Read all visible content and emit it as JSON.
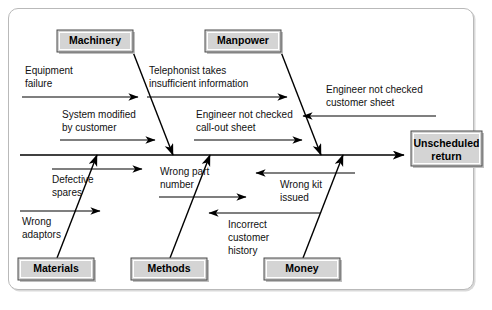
{
  "diagram": {
    "type": "fishbone-ishikawa",
    "title": "",
    "effect": {
      "label_line1": "Unscheduled",
      "label_line2": "return",
      "box_fill": "#d4d4d4",
      "box_stroke": "#4a4a4a"
    },
    "spine": {
      "x1": 20,
      "x2": 404,
      "y": 155,
      "arrow": "right"
    },
    "categories": [
      {
        "id": "machinery",
        "label": "Machinery",
        "position": "top",
        "box": {
          "x": 57,
          "y": 30,
          "w": 76,
          "h": 22
        },
        "rib": {
          "x1": 133,
          "y1": 52,
          "x2": 173,
          "y2": 155
        },
        "causes": [
          {
            "id": "equipment-failure",
            "line1": "Equipment",
            "line2": "failure",
            "text_x": 25,
            "text_y": 74,
            "arrow": {
              "x1": 22,
              "y1": 97,
              "x2": 138,
              "y2": 97,
              "dir": "right"
            }
          },
          {
            "id": "system-modified-by-customer",
            "line1": "System modified",
            "line2": "by customer",
            "text_x": 62,
            "text_y": 118,
            "arrow": {
              "x1": 60,
              "y1": 140,
              "x2": 155,
              "y2": 140,
              "dir": "right"
            }
          }
        ]
      },
      {
        "id": "manpower",
        "label": "Manpower",
        "position": "top",
        "box": {
          "x": 205,
          "y": 30,
          "w": 76,
          "h": 22
        },
        "rib": {
          "x1": 281,
          "y1": 52,
          "x2": 321,
          "y2": 155
        },
        "causes": [
          {
            "id": "telephonist-takes-insufficient-information",
            "line1": "Telephonist takes",
            "line2": "insufficient information",
            "text_x": 149,
            "text_y": 74,
            "arrow": {
              "x1": 147,
              "y1": 97,
              "x2": 287,
              "y2": 97,
              "dir": "right"
            }
          },
          {
            "id": "engineer-not-checked-call-out-sheet",
            "line1": "Engineer not checked",
            "line2": "call-out sheet",
            "text_x": 196,
            "text_y": 118,
            "arrow": {
              "x1": 194,
              "y1": 140,
              "x2": 302,
              "y2": 140,
              "dir": "right"
            }
          },
          {
            "id": "engineer-not-checked-customer-sheet",
            "line1": "Engineer not checked",
            "line2": "customer sheet",
            "text_x": 326,
            "text_y": 93,
            "arrow": {
              "x1": 436,
              "y1": 116,
              "x2": 302,
              "y2": 116,
              "dir": "left"
            }
          }
        ]
      },
      {
        "id": "materials",
        "label": "Materials",
        "position": "bottom",
        "box": {
          "x": 18,
          "y": 258,
          "w": 76,
          "h": 22
        },
        "rib": {
          "x1": 57,
          "y1": 258,
          "x2": 97,
          "y2": 155
        },
        "causes": [
          {
            "id": "defective-spares",
            "line1": "Defective",
            "line2": "spares",
            "text_x": 52,
            "text_y": 183,
            "arrow": {
              "x1": 52,
              "y1": 169,
              "x2": 142,
              "y2": 169,
              "dir": "right"
            }
          },
          {
            "id": "wrong-adaptors",
            "line1": "Wrong",
            "line2": "adaptors",
            "text_x": 22,
            "text_y": 225,
            "arrow": {
              "x1": 20,
              "y1": 211,
              "x2": 100,
              "y2": 211,
              "dir": "right"
            }
          }
        ]
      },
      {
        "id": "methods",
        "label": "Methods",
        "position": "bottom",
        "box": {
          "x": 131,
          "y": 258,
          "w": 76,
          "h": 22
        },
        "rib": {
          "x1": 170,
          "y1": 258,
          "x2": 210,
          "y2": 155
        },
        "causes": [
          {
            "id": "wrong-part-number",
            "line1": "Wrong part",
            "line2": "number",
            "text_x": 160,
            "text_y": 175,
            "arrow": {
              "x1": 159,
              "y1": 197,
              "x2": 246,
              "y2": 197,
              "dir": "right"
            }
          }
        ]
      },
      {
        "id": "money",
        "label": "Money",
        "position": "bottom",
        "box": {
          "x": 264,
          "y": 258,
          "w": 76,
          "h": 22
        },
        "rib": {
          "x1": 303,
          "y1": 258,
          "x2": 343,
          "y2": 155
        },
        "causes": [
          {
            "id": "wrong-kit-issued",
            "line1": "Wrong kit",
            "line2": "issued",
            "text_x": 280,
            "text_y": 188,
            "arrow": {
              "x1": 355,
              "y1": 173,
              "x2": 255,
              "y2": 173,
              "dir": "left"
            }
          },
          {
            "id": "incorrect-customer-history",
            "line1": "Incorrect",
            "line2": "customer",
            "line3": "history",
            "text_x": 228,
            "text_y": 228,
            "arrow": {
              "x1": 320,
              "y1": 213,
              "x2": 208,
              "y2": 213,
              "dir": "left"
            }
          }
        ]
      }
    ]
  }
}
